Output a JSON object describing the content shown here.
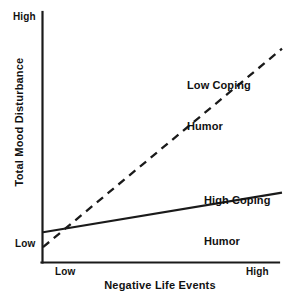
{
  "chart_data": {
    "type": "line",
    "title": "",
    "subtitle": "",
    "xlabel": "Negative Life Events",
    "ylabel": "Total Mood Disturbance",
    "x": [
      0,
      1
    ],
    "xlim": [
      0,
      1
    ],
    "ylim": [
      0,
      1
    ],
    "xticks": [
      "Low",
      "High"
    ],
    "yticks": [
      "Low",
      "High"
    ],
    "grid": false,
    "legend_position": "inline-annotation",
    "series": [
      {
        "name": "Low Coping Humor",
        "style": "dashed",
        "color": "#1a1a1a",
        "x": [
          0,
          1
        ],
        "values": [
          0.06,
          0.86
        ],
        "annotation": "Low Coping\nHumor"
      },
      {
        "name": "High Coping Humor",
        "style": "solid",
        "color": "#1a1a1a",
        "x": [
          0,
          1
        ],
        "values": [
          0.12,
          0.28
        ],
        "annotation": "High Coping\nHumor"
      }
    ],
    "annotations": [
      {
        "text": "Low Coping Humor",
        "x": 0.61,
        "y": 0.82
      },
      {
        "text": "High Coping Humor",
        "x": 0.68,
        "y": 0.38
      }
    ]
  },
  "axes": {
    "y": {
      "title": "Total Mood Disturbance",
      "tick_high": "High",
      "tick_low": "Low"
    },
    "x": {
      "title": "Negative Life Events",
      "tick_low": "Low",
      "tick_high": "High"
    }
  },
  "labels": {
    "low_coping_line1": "Low Coping",
    "low_coping_line2": "Humor",
    "high_coping_line1": "High Coping",
    "high_coping_line2": "Humor"
  },
  "colors": {
    "background": "#ffffff",
    "axis": "#1a1a1a",
    "text": "#111111",
    "series": "#1a1a1a"
  }
}
